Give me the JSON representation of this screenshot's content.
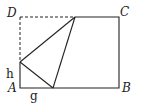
{
  "figure": {
    "type": "geometry-fold-diagram",
    "points": {
      "A": [
        20,
        88
      ],
      "B": [
        119,
        88
      ],
      "C": [
        119,
        17
      ],
      "D": [
        20,
        17
      ],
      "top_fold": [
        75,
        17
      ],
      "left_fold": [
        20,
        62
      ],
      "bottom_fold": [
        53,
        88
      ]
    },
    "labels": {
      "A": "A",
      "B": "B",
      "C": "C",
      "D": "D",
      "h": "h",
      "g": "g"
    },
    "colors": {
      "line": "#222222",
      "background": "#ffffff"
    }
  }
}
